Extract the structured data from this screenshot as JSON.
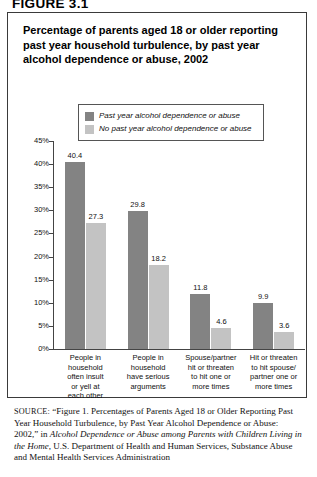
{
  "figure_number": "FIGURE 3.1",
  "chart_title": "Percentage of parents aged 18 or older reporting past year household turbulence, by past year alcohol dependence or abuse, 2002",
  "legend": {
    "items": [
      {
        "label": "Past year alcohol dependence or abuse",
        "color": "#838383",
        "swatch_icon": "legend-swatch-icon"
      },
      {
        "label": "No past year alcohol dependence or abuse",
        "color": "#c3c3c3",
        "swatch_icon": "legend-swatch-icon"
      }
    ]
  },
  "source_note": {
    "prefix": "SOURCE:",
    "part1": " “Figure 1. Percentages of Parents Aged 18 or Older Reporting Past Year Household Turbulence, by Past Year Alcohol Dependence or Abuse: 2002,” in ",
    "italic1": "Alcohol Dependence or Abuse among Parents with Children Living in the Home",
    "part2": ", U.S. Department of Health and Human Services, Substance Abuse and Mental Health Services Administration"
  },
  "chart_data": {
    "type": "bar",
    "title": "Percentage of parents aged 18 or older reporting past year household turbulence, by past year alcohol dependence or abuse, 2002",
    "xlabel": "",
    "ylabel": "",
    "ylim": [
      0,
      45
    ],
    "ytick_labels": [
      "45%",
      "40%",
      "35%",
      "30%",
      "25%",
      "20%",
      "15%",
      "10%",
      "5%",
      "0%"
    ],
    "ytick_values": [
      45,
      40,
      35,
      30,
      25,
      20,
      15,
      10,
      5,
      0
    ],
    "grid": false,
    "legend_position": "top-center",
    "categories": [
      "People in household often insult or yell at each other",
      "People in household have serious arguments",
      "Spouse/partner hit or threaten to hit one or more times",
      "Hit or threaten to hit spouse/ partner one or more times"
    ],
    "category_lines": [
      [
        "People in",
        "household",
        "often insult",
        "or yell at",
        "each other"
      ],
      [
        "People in",
        "household",
        "have serious",
        "arguments"
      ],
      [
        "Spouse/partner",
        "hit or threaten",
        "to hit one or",
        "more times"
      ],
      [
        "Hit or threaten",
        "to hit spouse/",
        "partner one or",
        "more times"
      ]
    ],
    "series": [
      {
        "name": "Past year alcohol dependence or abuse",
        "color": "#838383",
        "values": [
          40.4,
          29.8,
          11.8,
          9.9
        ],
        "value_labels": [
          "40.4",
          "29.8",
          "11.8",
          "9.9"
        ]
      },
      {
        "name": "No past year alcohol dependence or abuse",
        "color": "#c3c3c3",
        "values": [
          27.3,
          18.2,
          4.6,
          3.6
        ],
        "value_labels": [
          "27.3",
          "18.2",
          "4.6",
          "3.6"
        ]
      }
    ]
  }
}
